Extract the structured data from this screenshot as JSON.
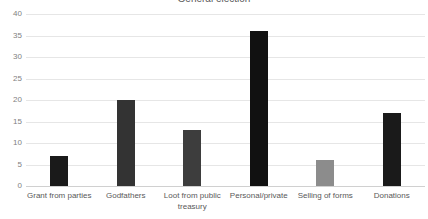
{
  "chart_data": {
    "type": "bar",
    "title": "General election",
    "xlabel": "",
    "ylabel": "",
    "categories": [
      "Grant from parties",
      "Godfathers",
      "Loot from public treasury",
      "Personal/private",
      "Selling of forms",
      "Donations"
    ],
    "values": [
      7,
      20,
      13,
      36,
      6,
      17
    ],
    "bar_colors": [
      "#1a1a1a",
      "#333333",
      "#3d3d3d",
      "#111111",
      "#8c8c8c",
      "#1a1a1a"
    ],
    "ylim": [
      0,
      40
    ],
    "yticks": [
      0,
      5,
      10,
      15,
      20,
      25,
      30,
      35,
      40
    ],
    "ytick_labels": [
      "0",
      "5",
      "10",
      "15",
      "20",
      "25",
      "30",
      "35",
      "40"
    ],
    "grid": true,
    "legend": null,
    "legend_position": "none",
    "gridline_color": "#e6e6e6",
    "axis_color": "#d0d0d0",
    "tick_label_color": "#7f7f7f",
    "category_label_color": "#595959",
    "background_color": "#ffffff"
  }
}
